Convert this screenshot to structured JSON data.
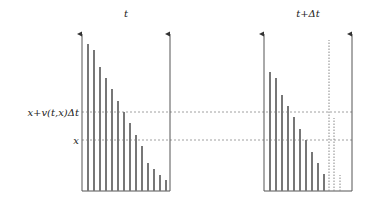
{
  "diagram": {
    "panels": [
      {
        "title": "t",
        "left_axis_x": 82,
        "right_axis_x": 170,
        "bars": [
          {
            "x": 88,
            "top": 44
          },
          {
            "x": 94,
            "top": 50
          },
          {
            "x": 100,
            "top": 67
          },
          {
            "x": 106,
            "top": 78
          },
          {
            "x": 112,
            "top": 89
          },
          {
            "x": 118,
            "top": 101
          },
          {
            "x": 124,
            "top": 112
          },
          {
            "x": 130,
            "top": 123
          },
          {
            "x": 136,
            "top": 135
          },
          {
            "x": 142,
            "top": 146
          },
          {
            "x": 148,
            "top": 163
          },
          {
            "x": 154,
            "top": 169
          },
          {
            "x": 160,
            "top": 175
          },
          {
            "x": 166,
            "top": 180
          }
        ],
        "dotted_bars": []
      },
      {
        "title": "t+Δt",
        "left_axis_x": 264,
        "right_axis_x": 352,
        "bars": [
          {
            "x": 270,
            "top": 72
          },
          {
            "x": 276,
            "top": 78
          },
          {
            "x": 282,
            "top": 95
          },
          {
            "x": 288,
            "top": 106
          },
          {
            "x": 294,
            "top": 117
          },
          {
            "x": 300,
            "top": 129
          },
          {
            "x": 306,
            "top": 140
          },
          {
            "x": 312,
            "top": 152
          },
          {
            "x": 318,
            "top": 163
          },
          {
            "x": 324,
            "top": 174
          }
        ],
        "dotted_bars": [
          {
            "x": 329,
            "top": 40
          },
          {
            "x": 334,
            "top": 118
          },
          {
            "x": 340,
            "top": 175
          }
        ]
      }
    ],
    "baseline_y": 191,
    "axis_top_y": 33,
    "levels": [
      {
        "label": "x+v(t,x)Δt",
        "y": 112
      },
      {
        "label": "x",
        "y": 140
      }
    ],
    "colors": {
      "bar": "#777777",
      "axis": "#555555",
      "dash": "#888888"
    }
  }
}
